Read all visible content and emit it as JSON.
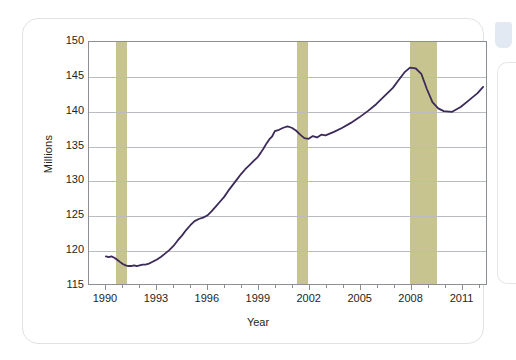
{
  "chart_data": {
    "type": "line",
    "title": "",
    "xlabel": "Year",
    "ylabel": "Millions",
    "xlim": [
      1989.0,
      2012.5
    ],
    "ylim": [
      115,
      150
    ],
    "grid": true,
    "legend": "none",
    "line_color": "#3b2a5a",
    "recession_band_color": "#c8c490",
    "axis_color": "#8b8f93",
    "gridline_color": "#b9bdc1",
    "text_color": "#231f20",
    "y_ticks": [
      115,
      120,
      125,
      130,
      135,
      140,
      145,
      150
    ],
    "y_tick_labels": [
      "115",
      "120",
      "125",
      "130",
      "135",
      "140",
      "145",
      "150"
    ],
    "x_ticks": [
      1990,
      1993,
      1996,
      1999,
      2002,
      2005,
      2008,
      2011
    ],
    "x_tick_labels": [
      "1990",
      "1993",
      "1996",
      "1999",
      "2002",
      "2005",
      "2008",
      "2011"
    ],
    "x_minor_ticks": [
      1991,
      1992,
      1994,
      1995,
      1997,
      1998,
      2000,
      2001,
      2003,
      2004,
      2006,
      2007,
      2009,
      2010,
      2012
    ],
    "recession_bands": [
      {
        "start": 1990.58,
        "end": 1991.25
      },
      {
        "start": 2001.25,
        "end": 2001.92
      },
      {
        "start": 2007.92,
        "end": 2009.5
      }
    ],
    "series": [
      {
        "name": "Employment",
        "x": [
          1990.0,
          1990.17,
          1990.33,
          1990.5,
          1990.67,
          1990.83,
          1991.0,
          1991.17,
          1991.33,
          1991.5,
          1991.67,
          1991.83,
          1992.0,
          1992.17,
          1992.33,
          1992.5,
          1992.67,
          1992.83,
          1993.0,
          1993.25,
          1993.5,
          1993.75,
          1994.0,
          1994.25,
          1994.5,
          1994.75,
          1995.0,
          1995.25,
          1995.5,
          1995.75,
          1996.0,
          1996.25,
          1996.5,
          1996.75,
          1997.0,
          1997.25,
          1997.5,
          1997.75,
          1998.0,
          1998.25,
          1998.5,
          1998.75,
          1999.0,
          1999.17,
          1999.33,
          1999.5,
          1999.67,
          1999.83,
          2000.0,
          2000.25,
          2000.5,
          2000.75,
          2001.0,
          2001.25,
          2001.5,
          2001.75,
          2002.0,
          2002.25,
          2002.5,
          2002.75,
          2003.0,
          2003.5,
          2004.0,
          2004.5,
          2005.0,
          2005.5,
          2006.0,
          2006.5,
          2007.0,
          2007.33,
          2007.67,
          2008.0,
          2008.33,
          2008.67,
          2009.0,
          2009.33,
          2009.67,
          2010.0,
          2010.5,
          2011.0,
          2011.5,
          2012.0,
          2012.33
        ],
        "y": [
          119.0,
          118.9,
          119.0,
          118.8,
          118.5,
          118.2,
          117.9,
          117.7,
          117.6,
          117.6,
          117.7,
          117.6,
          117.7,
          117.8,
          117.8,
          117.9,
          118.1,
          118.3,
          118.5,
          118.9,
          119.4,
          119.9,
          120.5,
          121.3,
          122.0,
          122.8,
          123.5,
          124.1,
          124.4,
          124.6,
          124.9,
          125.5,
          126.2,
          126.9,
          127.6,
          128.5,
          129.3,
          130.1,
          130.9,
          131.6,
          132.2,
          132.8,
          133.4,
          134.0,
          134.6,
          135.3,
          135.9,
          136.3,
          137.1,
          137.3,
          137.6,
          137.8,
          137.6,
          137.2,
          136.6,
          136.1,
          136.0,
          136.4,
          136.2,
          136.6,
          136.5,
          137.0,
          137.6,
          138.3,
          139.1,
          140.0,
          141.0,
          142.2,
          143.4,
          144.5,
          145.6,
          146.3,
          146.2,
          145.4,
          143.2,
          141.3,
          140.4,
          140.0,
          139.9,
          140.6,
          141.6,
          142.6,
          143.5
        ]
      }
    ]
  },
  "figure": {
    "caption": ""
  }
}
